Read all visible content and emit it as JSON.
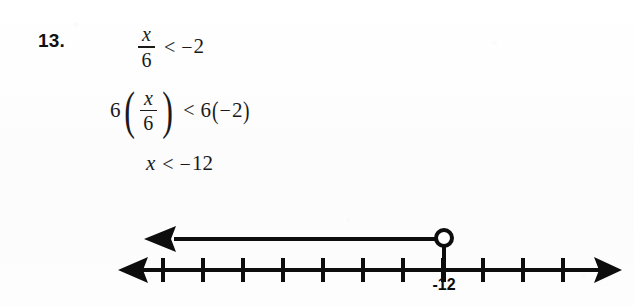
{
  "problem": {
    "number_label": "13.",
    "steps": [
      {
        "id": "step-1",
        "text": "x/6 < -2",
        "numerator": "x",
        "denominator": "6",
        "relation": "<",
        "rhs_sign": "−",
        "rhs_value": "2"
      },
      {
        "id": "step-2",
        "text": "6(x/6) < 6(-2)",
        "left_multiplier": "6",
        "numerator": "x",
        "denominator": "6",
        "relation": "<",
        "right_multiplier": "6",
        "rhs_sign": "−",
        "rhs_value": "2",
        "paren_open": "(",
        "paren_close": ")"
      },
      {
        "id": "step-3",
        "text": "x < -12",
        "variable": "x",
        "relation": "<",
        "rhs_sign": "−",
        "rhs_value": "12"
      }
    ]
  },
  "number_line": {
    "axis_label": "-12",
    "tick_count": 11,
    "marked_tick_index": 7,
    "endpoint_type": "open-circle",
    "ray_direction": "left",
    "ray_arrow": "left-arrow",
    "axis_left_arrow": "left-arrow",
    "axis_right_arrow": "right-arrow",
    "ink_color": "#0d0d0d",
    "geometry": {
      "axis_y": 270,
      "axis_x_start": 118,
      "axis_x_end": 622,
      "tick_first_x": 163,
      "tick_spacing": 40,
      "tick_half_height": 12,
      "ray_y": 239,
      "ray_arrow_tip_x": 144,
      "circle_cx": 444,
      "circle_cy": 238,
      "circle_r": 8,
      "label_x": 444,
      "label_y": 276
    }
  },
  "colors": {
    "ink": "#0d0d0d",
    "text": "#1a1a1a",
    "paper": "#fdfdfd"
  }
}
